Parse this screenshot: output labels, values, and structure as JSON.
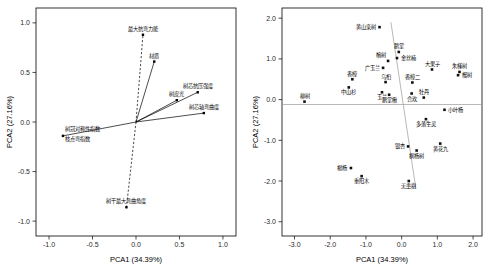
{
  "figure": {
    "panels": [
      "loadings-biplot",
      "scores-scatter"
    ]
  },
  "axes": {
    "xlabel": "PCA1 (34.39%)",
    "ylabel": "PCA2 (27.16%)"
  },
  "chart_data": [
    {
      "type": "scatter",
      "title": "",
      "subtitle": "",
      "panel": "left",
      "plot_kind": "pca-loadings-vector-plot",
      "xlabel": "PCA1 (34.39%)",
      "ylabel": "PCA2 (27.16%)",
      "xlim": [
        -1.15,
        1.15
      ],
      "ylim": [
        -1.15,
        1.15
      ],
      "xticks": [
        -1.0,
        -0.5,
        0.0,
        0.5,
        1.0
      ],
      "xticklabels": [
        "-1.0",
        "-0.5",
        "0.0",
        "0.5",
        "1.0"
      ],
      "yticks": [
        -1.0,
        -0.5,
        0.0,
        0.5,
        1.0
      ],
      "yticklabels": [
        "-1.0",
        "-0.5",
        "0.0",
        "0.5",
        "1.0"
      ],
      "grid": false,
      "legend": "none",
      "vectors": [
        {
          "label": "最大抗弯力能",
          "x": 0.08,
          "y": 0.88,
          "style": "dashed"
        },
        {
          "label": "材质",
          "x": 0.21,
          "y": 0.61,
          "style": "solid"
        },
        {
          "label": "树芯抗压强度",
          "x": 0.71,
          "y": 0.3,
          "style": "solid"
        },
        {
          "label": "树皮光",
          "x": 0.47,
          "y": 0.22,
          "style": "solid"
        },
        {
          "label": "树芯轴弯曲度",
          "x": 0.78,
          "y": 0.09,
          "style": "solid"
        },
        {
          "label": "树冠对称性指数",
          "x": -0.84,
          "y": -0.14,
          "style": "solid"
        },
        {
          "label": "枝点弯指数",
          "x": -0.84,
          "y": -0.14,
          "style": "solid"
        },
        {
          "label": "树干最大弯曲角度",
          "x": -0.11,
          "y": -0.86,
          "style": "dashed"
        }
      ]
    },
    {
      "type": "scatter",
      "title": "",
      "subtitle": "",
      "panel": "right",
      "plot_kind": "pca-scores-scatter",
      "xlabel": "PCA1 (34.39%)",
      "ylabel": "PCA2 (27.16%)",
      "xlim": [
        -3.35,
        2.25
      ],
      "ylim": [
        -3.35,
        2.25
      ],
      "xticks": [
        -3.0,
        -2.0,
        -1.0,
        0.0,
        1.0,
        2.0
      ],
      "xticklabels": [
        "-3.0",
        "-2.0",
        "-1.0",
        "0.0",
        "1.0",
        "2.0"
      ],
      "yticks": [
        -3.0,
        -2.0,
        -1.0,
        0.0,
        1.0,
        2.0
      ],
      "yticklabels": [
        "-3.0",
        "-2.0",
        "-1.0",
        "0.0",
        "1.0",
        "2.0"
      ],
      "grid": false,
      "legend": "none",
      "reference_lines": [
        {
          "kind": "horizontal",
          "y": -0.12
        },
        {
          "kind": "segment",
          "x1": -0.3,
          "y1": 1.9,
          "x2": 0.4,
          "y2": -2.2
        }
      ],
      "points": [
        {
          "label": "黄山栾树",
          "x": -0.62,
          "y": 1.78,
          "label_pos": "left"
        },
        {
          "label": "鹅掌",
          "x": -0.08,
          "y": 1.17,
          "label_pos": "top"
        },
        {
          "label": "榕树",
          "x": -0.38,
          "y": 0.95,
          "label_pos": "topleft"
        },
        {
          "label": "金丝楠",
          "x": -0.13,
          "y": 1.02,
          "label_pos": "right"
        },
        {
          "label": "广玉兰",
          "x": -0.52,
          "y": 0.78,
          "label_pos": "left"
        },
        {
          "label": "香樟",
          "x": -1.38,
          "y": 0.5,
          "label_pos": "top"
        },
        {
          "label": "大果子",
          "x": 0.85,
          "y": 0.74,
          "label_pos": "top"
        },
        {
          "label": "朱槿树",
          "x": 1.62,
          "y": 0.68,
          "label_pos": "top"
        },
        {
          "label": "榴树",
          "x": 1.58,
          "y": 0.6,
          "label_pos": "right"
        },
        {
          "label": "乌桕",
          "x": -0.45,
          "y": 0.43,
          "label_pos": "top"
        },
        {
          "label": "中山杉",
          "x": -1.48,
          "y": 0.3,
          "label_pos": "bottom"
        },
        {
          "label": "香樟二",
          "x": 0.3,
          "y": 0.42,
          "label_pos": "top"
        },
        {
          "label": "玉兰",
          "x": -0.55,
          "y": 0.18,
          "label_pos": "bottom"
        },
        {
          "label": "鹅掌楸",
          "x": -0.35,
          "y": 0.12,
          "label_pos": "bottom"
        },
        {
          "label": "合欢",
          "x": 0.28,
          "y": 0.15,
          "label_pos": "bottom"
        },
        {
          "label": "牡丹",
          "x": 0.62,
          "y": 0.05,
          "label_pos": "top"
        },
        {
          "label": "柳树",
          "x": -2.72,
          "y": -0.05,
          "label_pos": "top"
        },
        {
          "label": "小叶杨",
          "x": 1.2,
          "y": -0.25,
          "label_pos": "right"
        },
        {
          "label": "多落生灵",
          "x": 0.68,
          "y": -0.48,
          "label_pos": "bottom"
        },
        {
          "label": "银杏",
          "x": 0.18,
          "y": -1.15,
          "label_pos": "left"
        },
        {
          "label": "黄花九",
          "x": 1.08,
          "y": -1.08,
          "label_pos": "bottom"
        },
        {
          "label": "枫杨树",
          "x": 0.42,
          "y": -1.25,
          "label_pos": "bottom"
        },
        {
          "label": "楊杨",
          "x": -1.42,
          "y": -1.68,
          "label_pos": "left"
        },
        {
          "label": "重阳木",
          "x": -1.12,
          "y": -1.88,
          "label_pos": "bottom"
        },
        {
          "label": "无患樹",
          "x": 0.2,
          "y": -2.0,
          "label_pos": "bottom"
        }
      ]
    }
  ]
}
